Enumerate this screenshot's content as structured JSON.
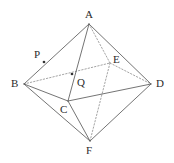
{
  "figure": {
    "name": "octahedron-with-points-p-and-q",
    "stroke_color": "#555555",
    "hidden_stroke_color": "#8c8c8c",
    "label_color": "#2b2b2b",
    "background_color": "#ffffff",
    "point_color": "#333333",
    "width": 174,
    "height": 163
  },
  "labels": {
    "a": "A",
    "b": "B",
    "c": "C",
    "d": "D",
    "e": "E",
    "f": "F",
    "p": "P",
    "q": "Q"
  },
  "vertices": [
    {
      "id": "A",
      "label": "A",
      "x": 89,
      "y": 24,
      "label_x": 85,
      "label_y": 9,
      "kind": "apex-top"
    },
    {
      "id": "B",
      "label": "B",
      "x": 24,
      "y": 84,
      "label_x": 11,
      "label_y": 78,
      "kind": "equator-left"
    },
    {
      "id": "C",
      "label": "C",
      "x": 68,
      "y": 101,
      "label_x": 60,
      "label_y": 104,
      "kind": "equator-front"
    },
    {
      "id": "D",
      "label": "D",
      "x": 151,
      "y": 84,
      "label_x": 156,
      "label_y": 78,
      "kind": "equator-right"
    },
    {
      "id": "E",
      "label": "E",
      "x": 110,
      "y": 63,
      "label_x": 113,
      "label_y": 54,
      "kind": "equator-back"
    },
    {
      "id": "F",
      "label": "F",
      "x": 90,
      "y": 141,
      "label_x": 86,
      "label_y": 145,
      "kind": "apex-bottom"
    }
  ],
  "marked_points": [
    {
      "id": "P",
      "label": "P",
      "x": 44,
      "y": 62,
      "label_x": 34,
      "label_y": 49,
      "on_segment": "A-B"
    },
    {
      "id": "Q",
      "label": "Q",
      "x": 72,
      "y": 74,
      "label_x": 77,
      "label_y": 77,
      "on_segment": "A-C"
    }
  ],
  "edges": [
    {
      "from": "A",
      "to": "B",
      "style": "solid"
    },
    {
      "from": "A",
      "to": "C",
      "style": "solid"
    },
    {
      "from": "A",
      "to": "D",
      "style": "solid"
    },
    {
      "from": "A",
      "to": "E",
      "style": "dotted"
    },
    {
      "from": "B",
      "to": "C",
      "style": "solid"
    },
    {
      "from": "B",
      "to": "F",
      "style": "solid"
    },
    {
      "from": "B",
      "to": "E",
      "style": "dotted"
    },
    {
      "from": "C",
      "to": "D",
      "style": "solid"
    },
    {
      "from": "C",
      "to": "F",
      "style": "solid"
    },
    {
      "from": "D",
      "to": "E",
      "style": "dotted"
    },
    {
      "from": "D",
      "to": "F",
      "style": "solid"
    },
    {
      "from": "E",
      "to": "F",
      "style": "dotted"
    }
  ]
}
